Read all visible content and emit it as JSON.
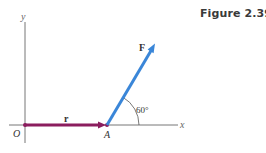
{
  "figure": {
    "caption": "Figure 2.39",
    "axes": {
      "x_label": "x",
      "y_label": "y",
      "origin_label": "O",
      "axis_color": "#777777"
    },
    "points": {
      "A": {
        "label": "A"
      }
    },
    "vectors": [
      {
        "name": "r",
        "label": "r",
        "from": "O",
        "to": "A",
        "color": "#8b1d5e"
      },
      {
        "name": "F",
        "label": "F",
        "from": "A",
        "direction_deg": 60,
        "color": "#3a86d8"
      }
    ],
    "angle": {
      "label": "60°",
      "value_deg": 60,
      "between": [
        "x-axis",
        "F"
      ]
    }
  }
}
